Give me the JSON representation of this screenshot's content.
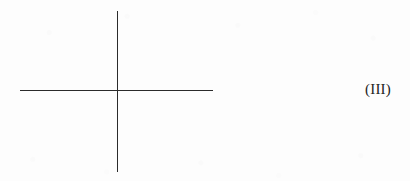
{
  "figure": {
    "label": "(III)",
    "background_color": "#fdfdfd",
    "stroke_color": "#2b2b2b",
    "label_color": "#1d1d1d",
    "canvas": {
      "width": 410,
      "height": 181
    },
    "axes": {
      "vertical": {
        "name": "vertical-axis",
        "x": 117,
        "y_top": 11,
        "y_bottom": 172,
        "length": 161,
        "thickness": 1.4
      },
      "horizontal": {
        "name": "horizontal-axis",
        "y": 90,
        "x_left": 20,
        "x_right": 213,
        "length": 193,
        "thickness": 1.4
      },
      "intersection": {
        "x": 117,
        "y": 90
      }
    },
    "label_position": {
      "left": 365,
      "center_y": 90,
      "font_size": 15
    }
  }
}
